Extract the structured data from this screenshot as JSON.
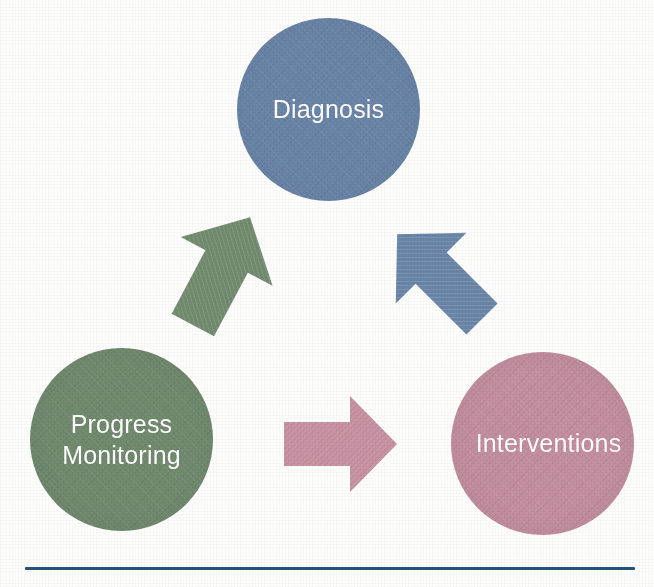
{
  "diagram": {
    "type": "cycle",
    "title": "",
    "background_color": "#fdfdfc",
    "nodes": [
      {
        "id": "diagnosis",
        "label": "Diagnosis",
        "color": "#6a85a8",
        "text_color": "#ffffff",
        "position": "top-center"
      },
      {
        "id": "progress_monitoring",
        "label_line1": "Progress",
        "label_line2": "Monitoring",
        "label": "Progress Monitoring",
        "color": "#718a6e",
        "text_color": "#ffffff",
        "position": "bottom-left"
      },
      {
        "id": "interventions",
        "label": "Interventions",
        "color": "#c48fa0",
        "text_color": "#ffffff",
        "position": "bottom-right"
      }
    ],
    "arrows": [
      {
        "id": "diagnosis-to-interventions",
        "from": "diagnosis",
        "to": "interventions",
        "color": "#6a85a8",
        "direction": "down-right"
      },
      {
        "id": "interventions-to-progress",
        "from": "interventions",
        "to": "progress_monitoring",
        "color": "#c48fa0",
        "direction": "left"
      },
      {
        "id": "progress-to-diagnosis",
        "from": "progress_monitoring",
        "to": "diagnosis",
        "color": "#718a6e",
        "direction": "up-right"
      }
    ],
    "divider": {
      "color": "#24527c",
      "label": "horizontal-rule"
    }
  }
}
